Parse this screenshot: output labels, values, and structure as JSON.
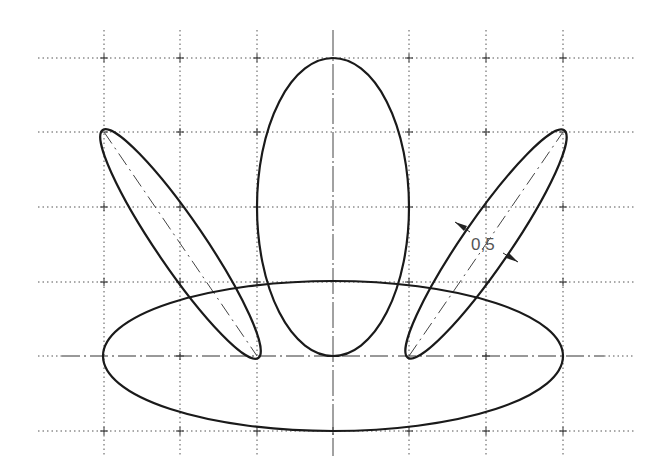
{
  "diagram": {
    "type": "technical-drawing",
    "grid": {
      "x_lines": [
        104,
        180,
        257,
        333,
        409,
        486,
        563
      ],
      "y_lines": [
        58,
        132,
        207,
        282,
        356,
        431
      ],
      "x_extent": [
        38,
        634
      ],
      "y_extent": [
        30,
        458
      ],
      "line_style": "dotted",
      "color": "#555555"
    },
    "shapes": [
      {
        "name": "base-ellipse",
        "cx": 333,
        "cy": 356,
        "rx": 230,
        "ry": 75,
        "rotation": 0
      },
      {
        "name": "center-ellipse",
        "cx": 333,
        "cy": 207,
        "rx": 76,
        "ry": 149,
        "rotation": 0
      },
      {
        "name": "left-tilted-ellipse",
        "axis_start": [
          104,
          132
        ],
        "axis_end": [
          257,
          356
        ],
        "half_width": 19
      },
      {
        "name": "right-tilted-ellipse",
        "axis_start": [
          409,
          356
        ],
        "axis_end": [
          563,
          132
        ],
        "half_width": 19
      }
    ],
    "dimension": {
      "label": "0,5",
      "on_shape": "right-tilted-ellipse",
      "color": "#555555"
    },
    "stroke_color": "#1a1a1a"
  }
}
